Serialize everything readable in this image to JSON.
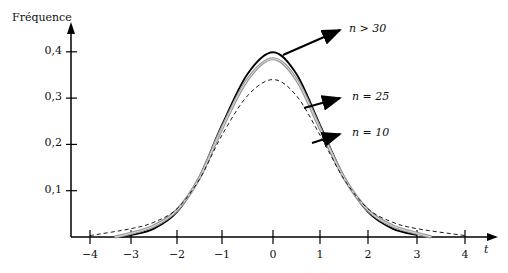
{
  "chart_data": {
    "type": "line",
    "title": "",
    "xlabel": "t",
    "ylabel": "Fréquence",
    "xlim": [
      -4.4,
      4.6
    ],
    "ylim": [
      0,
      0.45
    ],
    "grid": false,
    "x_ticks": [
      "−4",
      "−3",
      "−2",
      "−1",
      "0",
      "1",
      "2",
      "3",
      "4"
    ],
    "y_ticks": [
      "0,1",
      "0,2",
      "0,3",
      "0,4"
    ],
    "series": [
      {
        "name": "n > 30",
        "style": "solid-thick",
        "color": "#000000",
        "x": [
          -3.3,
          -3,
          -2.5,
          -2,
          -1.5,
          -1,
          -0.5,
          0,
          0.5,
          1,
          1.5,
          2,
          2.5,
          3
        ],
        "y": [
          0.0,
          0.004,
          0.018,
          0.054,
          0.13,
          0.242,
          0.352,
          0.399,
          0.352,
          0.242,
          0.13,
          0.054,
          0.018,
          0.004
        ]
      },
      {
        "name": "n = 25",
        "style": "solid-gray-double",
        "color": "#888888",
        "x": [
          -3.4,
          -3,
          -2.5,
          -2,
          -1.5,
          -1,
          -0.5,
          0,
          0.5,
          1,
          1.5,
          2,
          2.5,
          3,
          3.3
        ],
        "y": [
          0.0,
          0.008,
          0.024,
          0.058,
          0.128,
          0.235,
          0.34,
          0.385,
          0.34,
          0.235,
          0.128,
          0.058,
          0.024,
          0.008,
          0.0
        ]
      },
      {
        "name": "n = 10",
        "style": "dashed",
        "color": "#000000",
        "x": [
          -4,
          -3,
          -2.5,
          -2,
          -1.5,
          -1,
          -0.5,
          0,
          0.5,
          1,
          1.5,
          2,
          2.5,
          3,
          4
        ],
        "y": [
          0.003,
          0.018,
          0.032,
          0.061,
          0.125,
          0.22,
          0.305,
          0.34,
          0.305,
          0.22,
          0.125,
          0.061,
          0.032,
          0.018,
          0.003
        ]
      }
    ],
    "annotations": [
      {
        "text": "n > 30",
        "points_to": "n > 30"
      },
      {
        "text": "n = 25",
        "points_to": "n = 25"
      },
      {
        "text": "n = 10",
        "points_to": "n = 10"
      }
    ]
  },
  "labels": {
    "ylabel": "Fréquence",
    "xlabel": "t",
    "ann_n30": "n > 30",
    "ann_n25": "n = 25",
    "ann_n10": "n = 10"
  }
}
